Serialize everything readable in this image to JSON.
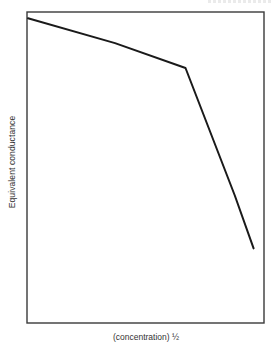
{
  "chart_data": {
    "type": "line",
    "title": "",
    "xlabel": "(concentration) ½",
    "ylabel": "Equivalent conductance",
    "xlim": [
      0,
      1
    ],
    "ylim": [
      0,
      1
    ],
    "grid": false,
    "legend": null,
    "ticks": {
      "x": [],
      "y": []
    },
    "series": [
      {
        "name": "Equivalent conductance",
        "x": [
          0.0,
          0.37,
          0.67,
          0.88,
          0.96
        ],
        "y": [
          0.98,
          0.9,
          0.82,
          0.41,
          0.24
        ]
      }
    ],
    "annotations": [
      {
        "note": "Gentle linear decline followed by sharp drop after break point at x≈0.67"
      }
    ]
  },
  "colors": {
    "line": "#1a1a1a",
    "frame": "#3a3a3a",
    "background": "#ffffff",
    "text": "#333333"
  },
  "layout": {
    "frame": {
      "left": 27,
      "top": 12,
      "right": 264,
      "bottom": 323
    }
  }
}
